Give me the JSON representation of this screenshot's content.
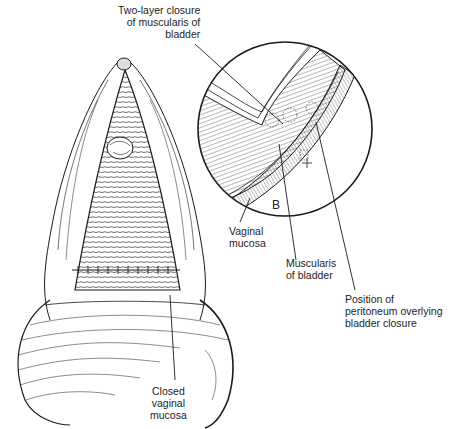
{
  "figure": {
    "type": "surgical illustration",
    "inset_letter": "B",
    "labels": {
      "two_layer_closure": [
        "Two-layer closure",
        "of muscularis of",
        "bladder"
      ],
      "vaginal_mucosa": [
        "Vaginal",
        "mucosa"
      ],
      "muscularis_of_bladder": [
        "Muscularis",
        "of bladder"
      ],
      "peritoneum_position": [
        "Position of",
        "peritoneum overlying",
        "bladder closure"
      ],
      "closed_vaginal_mucosa": [
        "Closed",
        "vaginal",
        "mucosa"
      ]
    }
  },
  "colors": {
    "ink": "#1a1a1a",
    "background": "#ffffff"
  }
}
